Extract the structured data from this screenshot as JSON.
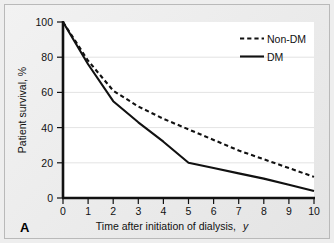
{
  "figure": {
    "panel_label": "A",
    "background_color": "#ebebeb",
    "plot_background_color": "#ffffff",
    "border_color": "#b9b9b9"
  },
  "chart_data": {
    "type": "line",
    "title": "",
    "xlabel_main": "Time after initiation of dialysis,",
    "xlabel_italic": "y",
    "ylabel": "Patient survival, %",
    "xlim": [
      0,
      10
    ],
    "ylim": [
      0,
      100
    ],
    "xticks": [
      0,
      1,
      2,
      3,
      4,
      5,
      6,
      7,
      8,
      9,
      10
    ],
    "xtick_labels": [
      "0",
      "1",
      "2",
      "3",
      "4",
      "5",
      "6",
      "7",
      "8",
      "9",
      "10"
    ],
    "yticks": [
      0,
      20,
      40,
      60,
      80,
      100
    ],
    "ytick_labels": [
      "0",
      "20",
      "40",
      "60",
      "80",
      "100"
    ],
    "grid": "horizontal",
    "legend_position": "top-right",
    "x": [
      0,
      1,
      2,
      3,
      4,
      5,
      6,
      7,
      8,
      9,
      10
    ],
    "series": [
      {
        "name": "Non-DM",
        "style": "dashed",
        "color": "#111111",
        "values": [
          100,
          78,
          61,
          52,
          45,
          39,
          33,
          27,
          22,
          17,
          12
        ]
      },
      {
        "name": "DM",
        "style": "solid",
        "color": "#111111",
        "values": [
          100,
          76,
          55,
          43,
          32,
          20,
          17,
          14,
          11,
          7.5,
          4
        ]
      }
    ],
    "legend": [
      {
        "label": "Non-DM",
        "style": "dashed"
      },
      {
        "label": "DM",
        "style": "solid"
      }
    ]
  }
}
